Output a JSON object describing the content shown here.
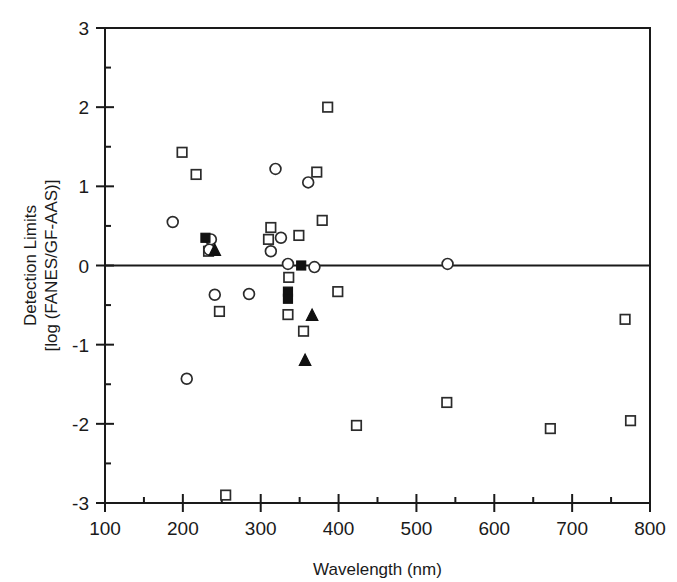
{
  "figure": {
    "width": 677,
    "height": 582,
    "background": "#ffffff",
    "ink_color": "#1a1a1a"
  },
  "chart_data": {
    "type": "scatter",
    "title": "",
    "xlabel": "Wavelength (nm)",
    "ylabel": "Detection Limits\n[log (FANES/GF-AAS)]",
    "ylabel_line1": "Detection Limits",
    "ylabel_line2": "[log (FANES/GF-AAS)]",
    "xlim": [
      100,
      800
    ],
    "ylim": [
      -3,
      3
    ],
    "xticks": [
      100,
      200,
      300,
      400,
      500,
      600,
      700,
      800
    ],
    "xtick_labels": [
      "100",
      "200",
      "300",
      "400",
      "500",
      "600",
      "700",
      "800"
    ],
    "xminor_step": 50,
    "yticks": [
      -3,
      -2,
      -1,
      0,
      1,
      2,
      3
    ],
    "ytick_labels": [
      "-3",
      "-2",
      "-1",
      "0",
      "1",
      "2",
      "3"
    ],
    "yminor_step": 0.5,
    "grid": false,
    "legend": "none",
    "reference_line_y": 0,
    "series": [
      {
        "name": "open-square",
        "marker": "open-square",
        "points": [
          [
            199,
            1.43
          ],
          [
            217,
            1.15
          ],
          [
            233,
            0.18
          ],
          [
            247,
            -0.58
          ],
          [
            313,
            0.48
          ],
          [
            310,
            0.33
          ],
          [
            336,
            -0.15
          ],
          [
            335,
            -0.62
          ],
          [
            349,
            0.38
          ],
          [
            355,
            -0.83
          ],
          [
            372,
            1.18
          ],
          [
            379,
            0.57
          ],
          [
            386,
            2.0
          ],
          [
            399,
            -0.33
          ],
          [
            423,
            -2.02
          ],
          [
            255,
            -2.9
          ],
          [
            539,
            -1.73
          ],
          [
            672,
            -2.06
          ],
          [
            768,
            -0.68
          ],
          [
            775,
            -1.96
          ]
        ]
      },
      {
        "name": "open-circle",
        "marker": "open-circle",
        "points": [
          [
            187,
            0.55
          ],
          [
            205,
            -1.43
          ],
          [
            236,
            0.33
          ],
          [
            234,
            0.2
          ],
          [
            241,
            -0.37
          ],
          [
            285,
            -0.36
          ],
          [
            319,
            1.22
          ],
          [
            326,
            0.35
          ],
          [
            313,
            0.18
          ],
          [
            335,
            0.02
          ],
          [
            361,
            1.05
          ],
          [
            369,
            -0.02
          ],
          [
            540,
            0.02
          ]
        ]
      },
      {
        "name": "filled-square",
        "marker": "filled-square",
        "points": [
          [
            229,
            0.35
          ],
          [
            335,
            -0.33
          ],
          [
            335,
            -0.42
          ],
          [
            352,
            0.0
          ]
        ]
      },
      {
        "name": "filled-triangle",
        "marker": "filled-triangle",
        "points": [
          [
            241,
            0.19
          ],
          [
            357,
            -1.2
          ],
          [
            366,
            -0.63
          ]
        ]
      }
    ]
  }
}
